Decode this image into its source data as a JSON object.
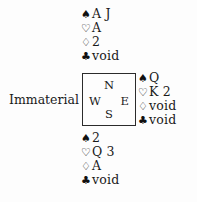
{
  "diagram": {
    "type": "bridge-deal",
    "compass": {
      "north_label": "N",
      "south_label": "S",
      "west_label": "W",
      "east_label": "E"
    },
    "suits": {
      "spade_symbol": "♠",
      "heart_symbol": "♡",
      "diamond_symbol": "♢",
      "club_symbol": "♣"
    },
    "hands": {
      "north": {
        "seat": "North",
        "spades": "A J",
        "hearts": "A",
        "diamonds": "2",
        "clubs": "void"
      },
      "east": {
        "seat": "East",
        "spades": "Q",
        "hearts": "K 2",
        "diamonds": "void",
        "clubs": "void"
      },
      "south": {
        "seat": "South",
        "spades": "2",
        "hearts": "Q 3",
        "diamonds": "A",
        "clubs": "void"
      },
      "west": {
        "seat": "West",
        "note": "Immaterial"
      }
    },
    "colors": {
      "ink": "#1a1a1a",
      "box_border": "#2b2b2b",
      "background": "#fdfdfd"
    }
  }
}
